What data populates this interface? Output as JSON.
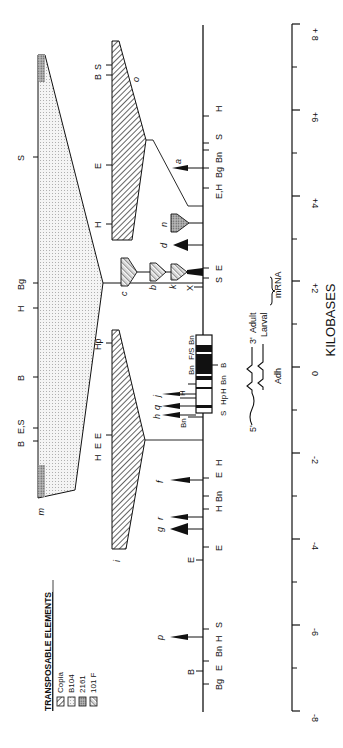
{
  "figure": {
    "orientation": "rotated-90-ccw",
    "axis": {
      "title": "KILOBASES",
      "ticks": [
        "+ 8",
        "+6",
        "+4",
        "+2",
        "0",
        "-2",
        "-4",
        "-6",
        "-8"
      ],
      "tick_values": [
        8,
        6,
        4,
        2,
        0,
        -2,
        -4,
        -6,
        -8
      ],
      "minor_ticks": [
        7,
        5,
        3,
        1,
        -1,
        -3,
        -5,
        -7
      ]
    },
    "legend": {
      "title": "TRANSPOSABLE ELEMENTS",
      "items": [
        {
          "label": "Copia",
          "pattern": "diagonal-hatch"
        },
        {
          "label": "B104",
          "pattern": "fine-dots"
        },
        {
          "label": "2161",
          "pattern": "dense-dots"
        },
        {
          "label": "101 F",
          "pattern": "cross-hatch"
        }
      ]
    },
    "gene": {
      "name": "Adh",
      "transcripts": [
        "Adult",
        "Larval"
      ],
      "transcript_group_label": "mRNA",
      "five_prime": "5'",
      "three_prime": "3'"
    },
    "main_line_sites": [
      {
        "label": "H",
        "kb": 6.0
      },
      {
        "label": "S",
        "kb": 5.6
      },
      {
        "label": "Bn",
        "kb": 5.4
      },
      {
        "label": "Bg",
        "kb": 5.0
      },
      {
        "label": "E,H",
        "kb": 4.6
      },
      {
        "label": "E",
        "kb": 2.4
      },
      {
        "label": "S",
        "kb": 2.3
      },
      {
        "label": "E",
        "kb": 2.1
      },
      {
        "label": "X",
        "kb": 1.9
      },
      {
        "label": "Bn",
        "kb": 1.0
      },
      {
        "label": "F/S",
        "kb": 0.8
      },
      {
        "label": "Bn",
        "kb": 0.5
      },
      {
        "label": "B",
        "kb": -0.2
      },
      {
        "label": "Bn",
        "kb": -0.6
      },
      {
        "label": "H",
        "kb": -0.8
      },
      {
        "label": "Hp",
        "kb": -1.0
      },
      {
        "label": "S",
        "kb": -1.3
      },
      {
        "label": "Bn",
        "kb": -1.4
      },
      {
        "label": "H",
        "kb": -2.6
      },
      {
        "label": "E",
        "kb": -2.7
      },
      {
        "label": "Bn",
        "kb": -3.0
      },
      {
        "label": "H",
        "kb": -3.3
      },
      {
        "label": "E",
        "kb": -4.2
      },
      {
        "label": "E",
        "kb": -4.5
      },
      {
        "label": "S",
        "kb": -6.0
      },
      {
        "label": "H",
        "kb": -6.3
      },
      {
        "label": "Bn",
        "kb": -6.5
      },
      {
        "label": "E",
        "kb": -6.7
      },
      {
        "label": "B",
        "kb": -6.9
      },
      {
        "label": "Bg",
        "kb": -7.3
      }
    ],
    "insertions": [
      {
        "label": "a",
        "kb": 5.0,
        "type": "small-arrow"
      },
      {
        "label": "o",
        "kb": 4.6,
        "type": "copia-trapezoid",
        "sites": [
          "B",
          "S",
          "E",
          "H"
        ]
      },
      {
        "label": "n",
        "kb": 3.6,
        "type": "2161-trapezoid"
      },
      {
        "label": "d",
        "kb": 3.0,
        "type": "arrow"
      },
      {
        "label": "c",
        "kb": 2.2,
        "type": "101F-trapezoid"
      },
      {
        "label": "b",
        "kb": 2.2,
        "type": "101F-trapezoid"
      },
      {
        "label": "k",
        "kb": 2.2,
        "type": "101F-trapezoid"
      },
      {
        "label": "m",
        "kb": 2.2,
        "type": "B104-large",
        "sites": [
          "S",
          "Bg",
          "H",
          "B",
          "E,S",
          "B"
        ]
      },
      {
        "label": "j",
        "kb": -0.6,
        "type": "arrow"
      },
      {
        "label": "q",
        "kb": -0.9,
        "type": "arrow"
      },
      {
        "label": "h",
        "kb": -1.2,
        "type": "arrow"
      },
      {
        "label": "i",
        "kb": -1.7,
        "type": "copia-trapezoid",
        "sites": [
          "Hp",
          "E",
          "E",
          "H"
        ]
      },
      {
        "label": "f",
        "kb": -2.6,
        "type": "arrow"
      },
      {
        "label": "r",
        "kb": -3.6,
        "type": "arrow"
      },
      {
        "label": "g",
        "kb": -3.9,
        "type": "arrow"
      },
      {
        "label": "p",
        "kb": -6.1,
        "type": "arrow"
      }
    ],
    "big_element_sites": [
      {
        "label": "S",
        "kb": 5.4
      },
      {
        "label": "Bg",
        "kb": 2.0
      },
      {
        "label": "H",
        "kb": 1.3
      },
      {
        "label": "B",
        "kb": 0.2
      },
      {
        "label": "E,S",
        "kb": -1.3
      },
      {
        "label": "B",
        "kb": -1.6
      }
    ],
    "copia_o_sites": [
      {
        "label": "B",
        "kb": 7.0
      },
      {
        "label": "S",
        "kb": 6.9
      },
      {
        "label": "E",
        "kb": 5.1
      },
      {
        "label": "H",
        "kb": 3.8
      }
    ],
    "copia_i_sites": [
      {
        "label": "Hp",
        "kb": 0.6
      },
      {
        "label": "E",
        "kb": -1.8
      },
      {
        "label": "E",
        "kb": -2.0
      },
      {
        "label": "H",
        "kb": -2.1
      }
    ]
  }
}
